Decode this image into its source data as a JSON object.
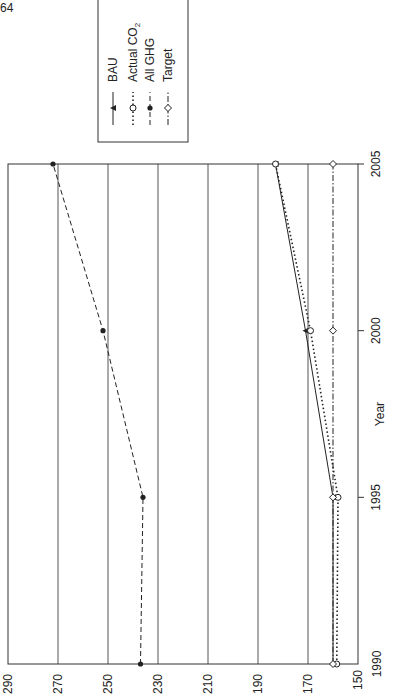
{
  "page_number": "64",
  "chart_data": {
    "type": "line",
    "orientation": "rotated-90-ccw",
    "title": "",
    "xlabel": "Year",
    "ylabel": "",
    "x": [
      1990,
      1995,
      2000,
      2005
    ],
    "x_ticks": [
      "1990",
      "1995",
      "2000",
      "2005"
    ],
    "y_ticks": [
      "150",
      "170",
      "190",
      "210",
      "230",
      "250",
      "270",
      "290"
    ],
    "ylim": [
      150,
      290
    ],
    "grid": "horizontal (value) gridlines at every 20",
    "legend_position": "top-right (rotated)",
    "series": [
      {
        "name": "BAU",
        "style": "solid, filled triangle",
        "values": [
          160,
          160,
          171,
          183
        ]
      },
      {
        "name": "Actual CO2",
        "style": "dotted, open circle",
        "values": [
          158.5,
          158,
          169,
          183
        ]
      },
      {
        "name": "All GHG",
        "style": "dashed, filled circle",
        "values": [
          237,
          236,
          252,
          272
        ]
      },
      {
        "name": "Target",
        "style": "dash-dot, open diamond",
        "values": [
          160,
          160,
          160,
          160
        ]
      }
    ]
  },
  "legend": {
    "items": [
      {
        "label": "BAU"
      },
      {
        "label": "Actual CO",
        "sub": "2"
      },
      {
        "label": "All GHG"
      },
      {
        "label": "Target"
      }
    ]
  }
}
